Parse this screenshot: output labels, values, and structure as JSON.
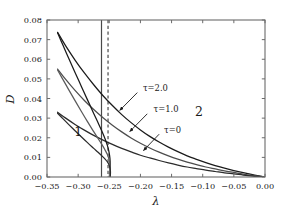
{
  "chart_data": {
    "type": "line",
    "title": "",
    "xlabel": "λ",
    "ylabel": "D",
    "xlim": [
      -0.35,
      0.0
    ],
    "ylim": [
      0.0,
      0.08
    ],
    "xticks": [
      -0.35,
      -0.3,
      -0.25,
      -0.2,
      -0.15,
      -0.1,
      -0.05,
      0.0
    ],
    "xticklabels": [
      "−0.35",
      "−0.30",
      "−0.25",
      "−0.20",
      "−0.15",
      "−0.10",
      "−0.05",
      "0.00"
    ],
    "yticks": [
      0.0,
      0.01,
      0.02,
      0.03,
      0.04,
      0.05,
      0.06,
      0.07,
      0.08
    ],
    "yticklabels": [
      "0.00",
      "0.01",
      "0.02",
      "0.03",
      "0.04",
      "0.05",
      "0.06",
      "0.07",
      "0.08"
    ],
    "grid": false,
    "legend": "none",
    "series": [
      {
        "name": "τ=2.0 upper",
        "color": "#1a1a1a",
        "style": "solid",
        "points": [
          [
            -0.333,
            0.0737
          ],
          [
            -0.32,
            0.0668
          ],
          [
            -0.305,
            0.0596
          ],
          [
            -0.29,
            0.053
          ],
          [
            -0.275,
            0.047
          ],
          [
            -0.26,
            0.0414
          ],
          [
            -0.245,
            0.0364
          ],
          [
            -0.23,
            0.0318
          ],
          [
            -0.215,
            0.0277
          ],
          [
            -0.2,
            0.024
          ],
          [
            -0.185,
            0.0207
          ],
          [
            -0.17,
            0.0178
          ],
          [
            -0.155,
            0.0152
          ],
          [
            -0.14,
            0.0129
          ],
          [
            -0.125,
            0.0108
          ],
          [
            -0.11,
            0.009
          ],
          [
            -0.095,
            0.0073
          ],
          [
            -0.08,
            0.0058
          ],
          [
            -0.065,
            0.0045
          ],
          [
            -0.05,
            0.0033
          ],
          [
            -0.035,
            0.0022
          ],
          [
            -0.02,
            0.0012
          ],
          [
            -0.008,
            0.0005
          ],
          [
            0.0,
            0.0
          ]
        ]
      },
      {
        "name": "τ=1.0 upper",
        "color": "#4d4d4d",
        "style": "solid",
        "points": [
          [
            -0.333,
            0.055
          ],
          [
            -0.32,
            0.0497
          ],
          [
            -0.305,
            0.0441
          ],
          [
            -0.29,
            0.039
          ],
          [
            -0.275,
            0.0344
          ],
          [
            -0.26,
            0.0302
          ],
          [
            -0.245,
            0.0264
          ],
          [
            -0.23,
            0.023
          ],
          [
            -0.215,
            0.0199
          ],
          [
            -0.2,
            0.0172
          ],
          [
            -0.185,
            0.0148
          ],
          [
            -0.17,
            0.0127
          ],
          [
            -0.155,
            0.0108
          ],
          [
            -0.14,
            0.0091
          ],
          [
            -0.125,
            0.0076
          ],
          [
            -0.11,
            0.0063
          ],
          [
            -0.095,
            0.0051
          ],
          [
            -0.08,
            0.0041
          ],
          [
            -0.065,
            0.0031
          ],
          [
            -0.05,
            0.0023
          ],
          [
            -0.035,
            0.0015
          ],
          [
            -0.02,
            0.0008
          ],
          [
            -0.008,
            0.0003
          ],
          [
            0.0,
            0.0
          ]
        ]
      },
      {
        "name": "τ=0 upper",
        "color": "#2b2b2b",
        "style": "solid",
        "points": [
          [
            -0.333,
            0.033
          ],
          [
            -0.32,
            0.03
          ],
          [
            -0.305,
            0.0268
          ],
          [
            -0.29,
            0.0239
          ],
          [
            -0.275,
            0.0212
          ],
          [
            -0.26,
            0.0188
          ],
          [
            -0.245,
            0.0166
          ],
          [
            -0.23,
            0.0146
          ],
          [
            -0.215,
            0.0128
          ],
          [
            -0.2,
            0.0111
          ],
          [
            -0.185,
            0.0097
          ],
          [
            -0.17,
            0.0084
          ],
          [
            -0.155,
            0.0072
          ],
          [
            -0.14,
            0.0061
          ],
          [
            -0.125,
            0.0051
          ],
          [
            -0.11,
            0.0043
          ],
          [
            -0.095,
            0.0035
          ],
          [
            -0.08,
            0.0028
          ],
          [
            -0.065,
            0.0021
          ],
          [
            -0.05,
            0.0016
          ],
          [
            -0.035,
            0.001
          ],
          [
            -0.02,
            0.0005
          ],
          [
            -0.008,
            0.0002
          ],
          [
            0.0,
            0.0
          ]
        ]
      },
      {
        "name": "τ=2.0 lower",
        "color": "#1a1a1a",
        "style": "solid",
        "points": [
          [
            -0.333,
            0.0735
          ],
          [
            -0.325,
            0.0676
          ],
          [
            -0.315,
            0.0604
          ],
          [
            -0.305,
            0.0533
          ],
          [
            -0.295,
            0.0463
          ],
          [
            -0.285,
            0.0393
          ],
          [
            -0.275,
            0.0324
          ],
          [
            -0.268,
            0.0276
          ],
          [
            -0.262,
            0.0234
          ],
          [
            -0.257,
            0.0196
          ],
          [
            -0.253,
            0.016
          ],
          [
            -0.2505,
            0.0128
          ],
          [
            -0.249,
            0.0096
          ],
          [
            -0.2485,
            0.006
          ],
          [
            -0.2487,
            0.0025
          ],
          [
            -0.2492,
            0.0
          ]
        ]
      },
      {
        "name": "τ=1.0 lower",
        "color": "#5a5a5a",
        "style": "solid",
        "points": [
          [
            -0.333,
            0.0545
          ],
          [
            -0.325,
            0.05
          ],
          [
            -0.315,
            0.0444
          ],
          [
            -0.305,
            0.0389
          ],
          [
            -0.295,
            0.0335
          ],
          [
            -0.285,
            0.0282
          ],
          [
            -0.275,
            0.0231
          ],
          [
            -0.268,
            0.0196
          ],
          [
            -0.262,
            0.0166
          ],
          [
            -0.257,
            0.0139
          ],
          [
            -0.253,
            0.0114
          ],
          [
            -0.2505,
            0.009
          ],
          [
            -0.249,
            0.0066
          ],
          [
            -0.2485,
            0.004
          ],
          [
            -0.249,
            0.0015
          ],
          [
            -0.25,
            0.0
          ]
        ]
      },
      {
        "name": "τ=0 lower",
        "color": "#2b2b2b",
        "style": "solid",
        "points": [
          [
            -0.333,
            0.0325
          ],
          [
            -0.325,
            0.0299
          ],
          [
            -0.315,
            0.0267
          ],
          [
            -0.305,
            0.0236
          ],
          [
            -0.295,
            0.0205
          ],
          [
            -0.285,
            0.0175
          ],
          [
            -0.275,
            0.0146
          ],
          [
            -0.268,
            0.0126
          ],
          [
            -0.262,
            0.0108
          ],
          [
            -0.257,
            0.0092
          ],
          [
            -0.253,
            0.0077
          ],
          [
            -0.2505,
            0.0062
          ],
          [
            -0.249,
            0.0046
          ],
          [
            -0.2482,
            0.003
          ],
          [
            -0.2482,
            0.0014
          ],
          [
            -0.2487,
            0.0
          ]
        ]
      }
    ],
    "vertical_lines": [
      {
        "name": "solid-vline",
        "x": -0.2625,
        "style": "solid",
        "color": "#4a4a4a"
      },
      {
        "name": "dashed-vline",
        "x": -0.252,
        "style": "dashed",
        "color": "#4a4a4a"
      }
    ],
    "annotations": [
      {
        "name": "tau-2-label",
        "text": "τ=2.0",
        "x": -0.196,
        "y": 0.0455,
        "arrow_from": [
          -0.205,
          0.043
        ],
        "arrow_to": [
          -0.233,
          0.034
        ]
      },
      {
        "name": "tau-1-label",
        "text": "τ=1.0",
        "x": -0.179,
        "y": 0.0348,
        "arrow_from": [
          -0.189,
          0.0322
        ],
        "arrow_to": [
          -0.217,
          0.0232
        ]
      },
      {
        "name": "tau-0-label",
        "text": "τ=0",
        "x": -0.162,
        "y": 0.0242,
        "arrow_from": [
          -0.17,
          0.0218
        ],
        "arrow_to": [
          -0.195,
          0.0135
        ]
      },
      {
        "name": "region-1-label",
        "text": "1",
        "x": -0.3,
        "y": 0.0228
      },
      {
        "name": "region-2-label",
        "text": "2",
        "x": -0.106,
        "y": 0.033
      }
    ]
  }
}
